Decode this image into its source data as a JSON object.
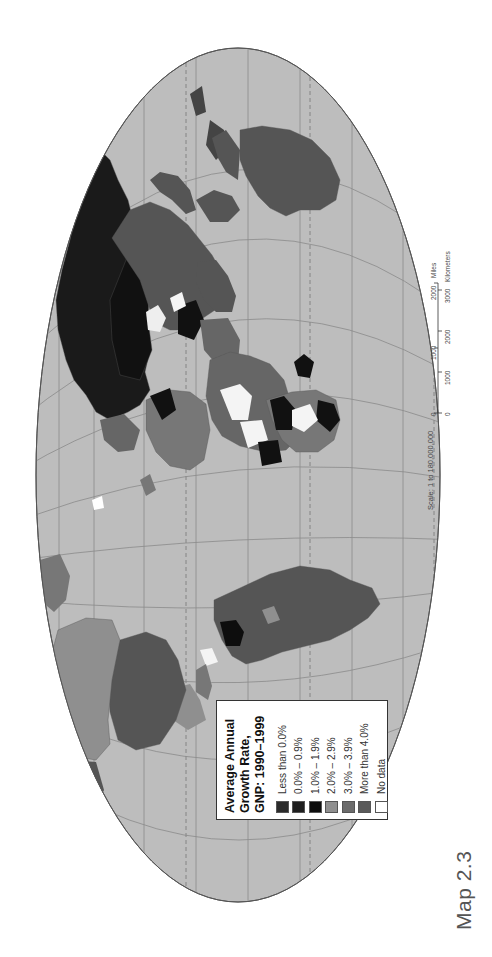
{
  "map": {
    "title": "Average Annual Growth Rate, GNP: 1990–1999",
    "orientation": "rotated 90° clockwise (north faces left)",
    "colors": {
      "ocean": "#bdbdbd",
      "border": "#4a4a4a",
      "graticule": "#8a8a8a"
    }
  },
  "legend": {
    "title_lines": [
      "Average Annual",
      "Growth Rate,",
      "GNP: 1990–1999"
    ],
    "items": [
      {
        "label": "Less than 0.0%",
        "color": "#2b2b2b"
      },
      {
        "label": "0.0% – 0.9%",
        "color": "#1f1f1f"
      },
      {
        "label": "1.0% – 1.9%",
        "color": "#0d0d0d"
      },
      {
        "label": "2.0% – 2.9%",
        "color": "#8f8f8f"
      },
      {
        "label": "3.0% – 3.9%",
        "color": "#6b6b6b"
      },
      {
        "label": "More than 4.0%",
        "color": "#5a5a5a"
      },
      {
        "label": "No data",
        "color": "#ffffff"
      }
    ]
  },
  "scale": {
    "text": "Scale: 1 to 180,000,000",
    "miles_label": "Miles",
    "miles_ticks": [
      "0",
      "1000",
      "2000"
    ],
    "km_label": "Kilometers",
    "km_ticks": [
      "0",
      "1000",
      "2000",
      "3000"
    ]
  },
  "caption": "Map 2.3"
}
